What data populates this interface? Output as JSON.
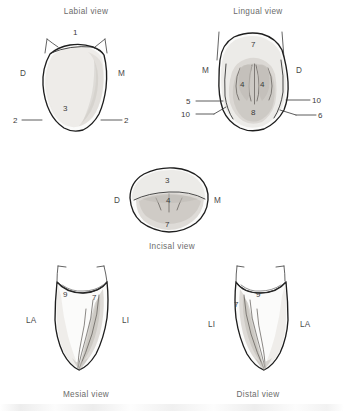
{
  "figure": {
    "background_color": "#ffffff",
    "line_color": "#1e1e1e",
    "label_color": "#4a4a4a"
  },
  "views": {
    "labial": {
      "title": "Labial view",
      "side_left": "D",
      "side_right": "M",
      "callouts": [
        {
          "number": "1",
          "position": "crown-incisal-top"
        },
        {
          "number": "3",
          "position": "crown-center"
        },
        {
          "number": "2",
          "position": "cervical-left"
        },
        {
          "number": "2",
          "position": "cervical-right"
        }
      ]
    },
    "lingual": {
      "title": "Lingual view",
      "side_left": "M",
      "side_right": "D",
      "callouts": [
        {
          "number": "7",
          "position": "cingulum-top"
        },
        {
          "number": "4",
          "position": "fossa-left"
        },
        {
          "number": "4",
          "position": "fossa-right"
        },
        {
          "number": "8",
          "position": "lingual-center"
        },
        {
          "number": "5",
          "position": "cervical-left-upper"
        },
        {
          "number": "10",
          "position": "cervical-left-lower"
        },
        {
          "number": "10",
          "position": "cervical-right-upper"
        },
        {
          "number": "6",
          "position": "cervical-right-lower"
        }
      ]
    },
    "incisal": {
      "title": "Incisal view",
      "side_left": "D",
      "side_right": "M",
      "callouts": [
        {
          "number": "3",
          "position": "labial-top"
        },
        {
          "number": "4",
          "position": "fossa-center"
        },
        {
          "number": "7",
          "position": "lingual-bottom"
        }
      ]
    },
    "mesial": {
      "title": "Mesial view",
      "side_left": "LA",
      "side_right": "LI",
      "callouts": [
        {
          "number": "9",
          "position": "cervical-line"
        },
        {
          "number": "7",
          "position": "lingual-ridge"
        }
      ]
    },
    "distal": {
      "title": "Distal view",
      "side_left": "LI",
      "side_right": "LA",
      "callouts": [
        {
          "number": "9",
          "position": "cervical-line"
        },
        {
          "number": "7",
          "position": "lingual-ridge"
        }
      ]
    }
  }
}
